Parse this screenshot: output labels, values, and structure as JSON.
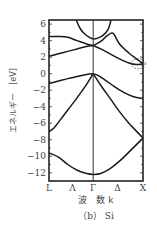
{
  "chart_data": {
    "type": "line",
    "title": "",
    "caption": "（b） Si",
    "xlabel": "波　数 k",
    "ylabel": "エネルギー　[eV]",
    "ylim": [
      -13,
      6.5
    ],
    "yticks": [
      6,
      4,
      2,
      0,
      -2,
      -4,
      -6,
      -8,
      -10,
      -12
    ],
    "ytick_labels": [
      "6",
      "4",
      "2",
      "0",
      "−2",
      "−4",
      "−6",
      "−8",
      "−10",
      "−12"
    ],
    "k_points": [
      {
        "label": "L",
        "pos": 0.0
      },
      {
        "label": "Λ",
        "pos": 0.25
      },
      {
        "label": "Γ",
        "pos": 0.47
      },
      {
        "label": "Δ",
        "pos": 0.73
      },
      {
        "label": "X",
        "pos": 1.0
      }
    ],
    "grid": false,
    "legend": "none",
    "annotation": "dotted circle near X at conduction band minimum (~1.1 eV)",
    "series": [
      {
        "name": "band-valence-1",
        "points": [
          [
            0,
            -9.6
          ],
          [
            0.1,
            -10.1
          ],
          [
            0.2,
            -11
          ],
          [
            0.3,
            -11.7
          ],
          [
            0.4,
            -12.1
          ],
          [
            0.47,
            -12.2
          ],
          [
            0.55,
            -12.1
          ],
          [
            0.65,
            -11.5
          ],
          [
            0.75,
            -10.6
          ],
          [
            0.85,
            -9.5
          ],
          [
            1.0,
            -7.8
          ]
        ]
      },
      {
        "name": "band-valence-2",
        "points": [
          [
            0,
            -7.0
          ],
          [
            0.05,
            -6.6
          ],
          [
            0.12,
            -5.6
          ],
          [
            0.2,
            -4.4
          ],
          [
            0.3,
            -2.9
          ],
          [
            0.4,
            -1.3
          ],
          [
            0.47,
            0.0
          ]
        ]
      },
      {
        "name": "band-valence-2-gx",
        "points": [
          [
            0.47,
            0.0
          ],
          [
            0.55,
            -1.4
          ],
          [
            0.65,
            -3.0
          ],
          [
            0.75,
            -4.6
          ],
          [
            0.85,
            -6.0
          ],
          [
            0.95,
            -7.2
          ],
          [
            1.0,
            -7.8
          ]
        ]
      },
      {
        "name": "band-valence-3",
        "points": [
          [
            0,
            -1.2
          ],
          [
            0.1,
            -0.9
          ],
          [
            0.2,
            -0.6
          ],
          [
            0.3,
            -0.35
          ],
          [
            0.4,
            -0.1
          ],
          [
            0.47,
            0.0
          ]
        ]
      },
      {
        "name": "band-valence-3-gx",
        "points": [
          [
            0.47,
            0.0
          ],
          [
            0.52,
            -0.2
          ],
          [
            0.6,
            -0.8
          ],
          [
            0.7,
            -1.6
          ],
          [
            0.8,
            -2.3
          ],
          [
            0.9,
            -2.8
          ],
          [
            1.0,
            -3.0
          ]
        ]
      },
      {
        "name": "band-conduction-1",
        "points": [
          [
            0,
            2.1
          ],
          [
            0.1,
            2.4
          ],
          [
            0.2,
            2.7
          ],
          [
            0.3,
            3.0
          ],
          [
            0.4,
            3.3
          ],
          [
            0.47,
            3.4
          ]
        ]
      },
      {
        "name": "band-conduction-1-gx",
        "points": [
          [
            0.47,
            3.4
          ],
          [
            0.55,
            3.0
          ],
          [
            0.65,
            2.4
          ],
          [
            0.75,
            1.8
          ],
          [
            0.85,
            1.3
          ],
          [
            0.93,
            1.1
          ],
          [
            1.0,
            1.2
          ]
        ]
      },
      {
        "name": "band-conduction-2",
        "points": [
          [
            0,
            4.5
          ],
          [
            0.1,
            4.5
          ],
          [
            0.2,
            4.4
          ],
          [
            0.3,
            4.0
          ],
          [
            0.4,
            3.6
          ],
          [
            0.47,
            3.4
          ]
        ]
      },
      {
        "name": "band-conduction-2-gx",
        "points": [
          [
            0.47,
            3.4
          ],
          [
            0.55,
            3.9
          ],
          [
            0.62,
            4.6
          ],
          [
            0.68,
            4.9
          ],
          [
            0.75,
            3.6
          ],
          [
            0.85,
            2.5
          ],
          [
            0.93,
            1.8
          ],
          [
            1.0,
            1.2
          ]
        ]
      },
      {
        "name": "band-conduction-3",
        "points": [
          [
            0.29,
            6.5
          ],
          [
            0.33,
            5.5
          ],
          [
            0.38,
            4.8
          ],
          [
            0.43,
            4.4
          ],
          [
            0.47,
            4.2
          ],
          [
            0.52,
            4.3
          ],
          [
            0.58,
            4.7
          ],
          [
            0.63,
            5.4
          ],
          [
            0.66,
            6.5
          ]
        ]
      }
    ]
  }
}
